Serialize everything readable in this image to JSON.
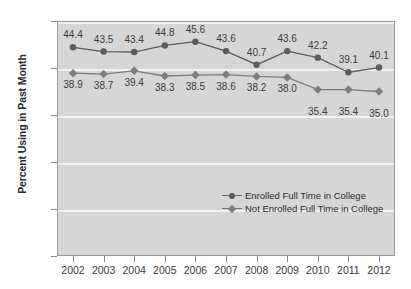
{
  "chart_data": {
    "type": "line",
    "title": "",
    "xlabel": "",
    "ylabel": "Percent Using in Past Month",
    "ylim": [
      0,
      50
    ],
    "yticks": [
      0,
      10,
      20,
      30,
      40,
      50
    ],
    "grid": true,
    "legend_position": "inside-lower-right",
    "categories": [
      "2002",
      "2003",
      "2004",
      "2005",
      "2006",
      "2007",
      "2008",
      "2009",
      "2010",
      "2011",
      "2012"
    ],
    "series": [
      {
        "name": "Enrolled Full Time in College",
        "marker": "circle",
        "color": "#5c5c5c",
        "values": [
          44.4,
          43.5,
          43.4,
          44.8,
          45.6,
          43.6,
          40.7,
          43.6,
          42.2,
          39.1,
          40.1
        ],
        "labels": [
          "44.4",
          "43.5",
          "43.4",
          "44.8",
          "45.6",
          "43.6",
          "40.7",
          "43.6",
          "42.2",
          "39.1",
          "40.1"
        ]
      },
      {
        "name": "Not Enrolled Full Time in College",
        "marker": "diamond",
        "color": "#7d7d7d",
        "values": [
          38.9,
          38.7,
          39.4,
          38.3,
          38.5,
          38.6,
          38.2,
          38.0,
          35.4,
          35.4,
          35.0
        ],
        "labels": [
          "38.9",
          "38.7",
          "39.4",
          "38.3",
          "38.5",
          "38.6",
          "38.2",
          "38.0",
          "35.4",
          "35.4",
          "35.0"
        ]
      }
    ]
  },
  "axis": {
    "y_title": "Percent Using in Past Month",
    "y_tick_labels": [
      "50",
      "40",
      "30",
      "20",
      "10",
      "0"
    ],
    "x_tick_labels": [
      "2002",
      "2003",
      "2004",
      "2005",
      "2006",
      "2007",
      "2008",
      "2009",
      "2010",
      "2011",
      "2012"
    ]
  },
  "legend": {
    "entries": [
      {
        "label": "Enrolled Full Time in College"
      },
      {
        "label": "Not Enrolled Full Time in College"
      }
    ]
  },
  "colors": {
    "plot_background": "#d6d6d6",
    "gridline": "#f2f2f2",
    "series_enrolled": "#5c5c5c",
    "series_not_enrolled": "#7d7d7d",
    "axis": "#8a8a8a",
    "text": "#3a3a3a"
  }
}
